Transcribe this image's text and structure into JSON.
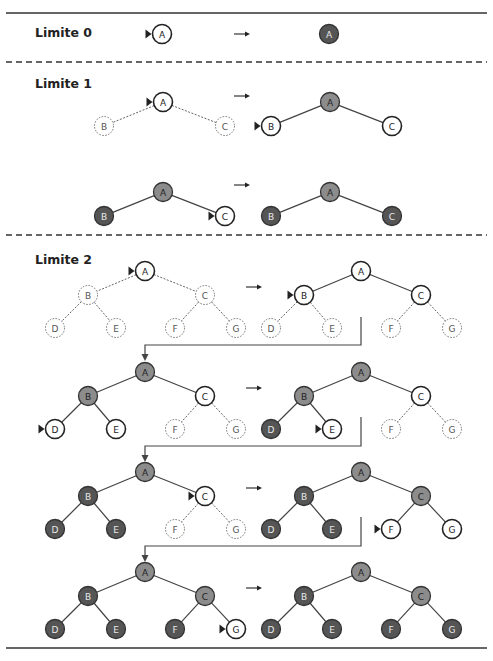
{
  "figure": {
    "colors": {
      "rule": "#333333",
      "unvisited_fill": "#ffffff",
      "frontier_fill": "#8c8c8c",
      "expanded_fill": "#555555",
      "edge": "#444444",
      "dashed_edge": "#666666",
      "label_dark": "#222222",
      "label_light": "#e8e8e8"
    },
    "legend_semantics": {
      "pointer": "triangle marker points to node currently being examined",
      "dotted_circle": "node not yet generated",
      "white_solid_circle": "node generated (in frontier)",
      "gray_circle": "node expanded, children being explored",
      "dark_circle": "node fully explored"
    }
  },
  "sections": [
    {
      "label": "Limite 0",
      "steps": [
        {
          "before": {
            "nodes": [
              {
                "id": "A",
                "state": "open",
                "pointer": true
              }
            ]
          },
          "after": {
            "nodes": [
              {
                "id": "A",
                "state": "done"
              }
            ]
          }
        }
      ]
    },
    {
      "label": "Limite 1",
      "steps": [
        {
          "before": {
            "nodes": [
              {
                "id": "A",
                "state": "open",
                "pointer": true
              },
              {
                "id": "B",
                "state": "ghost"
              },
              {
                "id": "C",
                "state": "ghost"
              }
            ]
          },
          "after": {
            "nodes": [
              {
                "id": "A",
                "state": "active"
              },
              {
                "id": "B",
                "state": "open",
                "pointer": true
              },
              {
                "id": "C",
                "state": "open"
              }
            ]
          }
        },
        {
          "before": {
            "nodes": [
              {
                "id": "A",
                "state": "active"
              },
              {
                "id": "B",
                "state": "done"
              },
              {
                "id": "C",
                "state": "open",
                "pointer": true
              }
            ]
          },
          "after": {
            "nodes": [
              {
                "id": "A",
                "state": "active"
              },
              {
                "id": "B",
                "state": "done"
              },
              {
                "id": "C",
                "state": "done"
              }
            ]
          }
        }
      ]
    },
    {
      "label": "Limite 2",
      "steps": [
        {
          "before": {
            "nodes": [
              {
                "id": "A",
                "state": "open",
                "pointer": true
              },
              {
                "id": "B",
                "state": "ghost"
              },
              {
                "id": "C",
                "state": "ghost"
              },
              {
                "id": "D",
                "state": "ghost"
              },
              {
                "id": "E",
                "state": "ghost"
              },
              {
                "id": "F",
                "state": "ghost"
              },
              {
                "id": "G",
                "state": "ghost"
              }
            ]
          },
          "after": {
            "nodes": [
              {
                "id": "A",
                "state": "open"
              },
              {
                "id": "B",
                "state": "open",
                "pointer": true
              },
              {
                "id": "C",
                "state": "open"
              },
              {
                "id": "D",
                "state": "ghost"
              },
              {
                "id": "E",
                "state": "ghost"
              },
              {
                "id": "F",
                "state": "ghost"
              },
              {
                "id": "G",
                "state": "ghost"
              }
            ]
          }
        },
        {
          "before": {
            "nodes": [
              {
                "id": "A",
                "state": "active"
              },
              {
                "id": "B",
                "state": "active"
              },
              {
                "id": "C",
                "state": "open"
              },
              {
                "id": "D",
                "state": "open",
                "pointer": true
              },
              {
                "id": "E",
                "state": "open"
              },
              {
                "id": "F",
                "state": "ghost"
              },
              {
                "id": "G",
                "state": "ghost"
              }
            ]
          },
          "after": {
            "nodes": [
              {
                "id": "A",
                "state": "active"
              },
              {
                "id": "B",
                "state": "active"
              },
              {
                "id": "C",
                "state": "open"
              },
              {
                "id": "D",
                "state": "done"
              },
              {
                "id": "E",
                "state": "open",
                "pointer": true
              },
              {
                "id": "F",
                "state": "ghost"
              },
              {
                "id": "G",
                "state": "ghost"
              }
            ]
          }
        },
        {
          "before": {
            "nodes": [
              {
                "id": "A",
                "state": "active"
              },
              {
                "id": "B",
                "state": "done"
              },
              {
                "id": "C",
                "state": "open",
                "pointer": true
              },
              {
                "id": "D",
                "state": "done"
              },
              {
                "id": "E",
                "state": "done"
              },
              {
                "id": "F",
                "state": "ghost"
              },
              {
                "id": "G",
                "state": "ghost"
              }
            ]
          },
          "after": {
            "nodes": [
              {
                "id": "A",
                "state": "active"
              },
              {
                "id": "B",
                "state": "done"
              },
              {
                "id": "C",
                "state": "active"
              },
              {
                "id": "D",
                "state": "done"
              },
              {
                "id": "E",
                "state": "done"
              },
              {
                "id": "F",
                "state": "open",
                "pointer": true
              },
              {
                "id": "G",
                "state": "open"
              }
            ]
          }
        },
        {
          "before": {
            "nodes": [
              {
                "id": "A",
                "state": "active"
              },
              {
                "id": "B",
                "state": "done"
              },
              {
                "id": "C",
                "state": "active"
              },
              {
                "id": "D",
                "state": "done"
              },
              {
                "id": "E",
                "state": "done"
              },
              {
                "id": "F",
                "state": "done"
              },
              {
                "id": "G",
                "state": "open",
                "pointer": true
              }
            ]
          },
          "after": {
            "nodes": [
              {
                "id": "A",
                "state": "active"
              },
              {
                "id": "B",
                "state": "done"
              },
              {
                "id": "C",
                "state": "active"
              },
              {
                "id": "D",
                "state": "done"
              },
              {
                "id": "E",
                "state": "done"
              },
              {
                "id": "F",
                "state": "done"
              },
              {
                "id": "G",
                "state": "done"
              }
            ]
          }
        }
      ]
    }
  ],
  "transition_arrow": "→"
}
